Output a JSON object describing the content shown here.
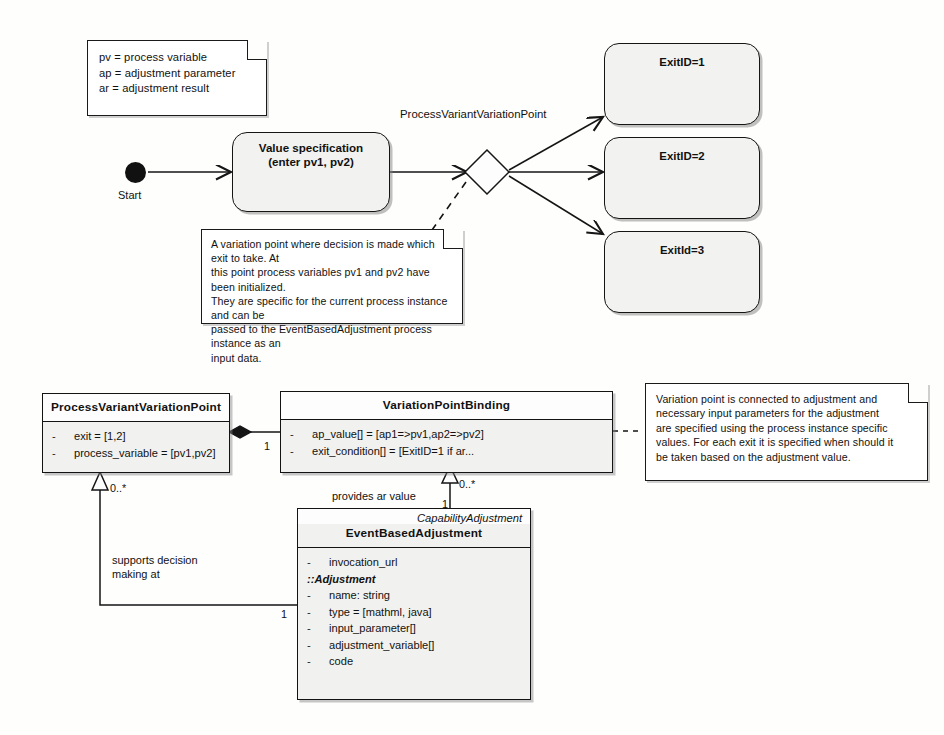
{
  "diagram": {
    "stroke_color": "#151515",
    "node_fill": "#f2f2f0",
    "note_fill": "#ffffff"
  },
  "legend_note": {
    "text": "pv = process variable\nap = adjustment parameter\nar = adjustment result"
  },
  "activity": {
    "start_label": "Start",
    "value_spec": {
      "label": "Value specification\n(enter pv1, pv2)"
    },
    "decision_label": "ProcessVariantVariationPoint",
    "exits": [
      {
        "label": "ExitID=1"
      },
      {
        "label": "ExitID=2"
      },
      {
        "label": "ExitId=3"
      }
    ],
    "decision_note": {
      "text": "A variation point where decision is made which exit to take. At\nthis point process variables pv1 and pv2 have been initialized.\nThey are specific for the current process instance and can be\npassed to the EventBasedAdjustment process instance as an\ninput data."
    }
  },
  "classes": {
    "process_variant_variation_point": {
      "name": "ProcessVariantVariationPoint",
      "attributes": [
        {
          "visibility": "-",
          "text": "exit = [1,2]"
        },
        {
          "visibility": "-",
          "text": "process_variable = [pv1,pv2]"
        }
      ]
    },
    "variation_point_binding": {
      "name": "VariationPointBinding",
      "attributes": [
        {
          "visibility": "-",
          "text": "ap_value[] = [ap1=>pv1,ap2=>pv2]"
        },
        {
          "visibility": "-",
          "text": "exit_condition[] = [ExitID=1 if ar..."
        }
      ]
    },
    "event_based_adjustment": {
      "stereotype": "CapabilityAdjustment",
      "name": "EventBasedAdjustment",
      "attributes_top": [
        {
          "visibility": "-",
          "text": "invocation_url"
        }
      ],
      "section_label": "::Adjustment",
      "attributes_inherited": [
        {
          "visibility": "-",
          "text": "name: string"
        },
        {
          "visibility": "-",
          "text": "type = [mathml, java]"
        },
        {
          "visibility": "-",
          "text": "input_parameter[]"
        },
        {
          "visibility": "-",
          "text": "adjustment_variable[]"
        },
        {
          "visibility": "-",
          "text": "code"
        }
      ]
    }
  },
  "class_note": {
    "text": "Variation point is connected to adjustment and\nnecessary input parameters for the adjustment\nare specified using the process instance specific\nvalues. For each exit it is specified when should it\nbe taken based on the adjustment value."
  },
  "associations": {
    "composition_mult": "1",
    "generalization_mult": "0..*",
    "supports_label": "supports decision\nmaking at",
    "supports_source_mult": "1",
    "provides_label": "provides ar value",
    "provides_target_mult": "0..*",
    "provides_source_mult": "1"
  }
}
